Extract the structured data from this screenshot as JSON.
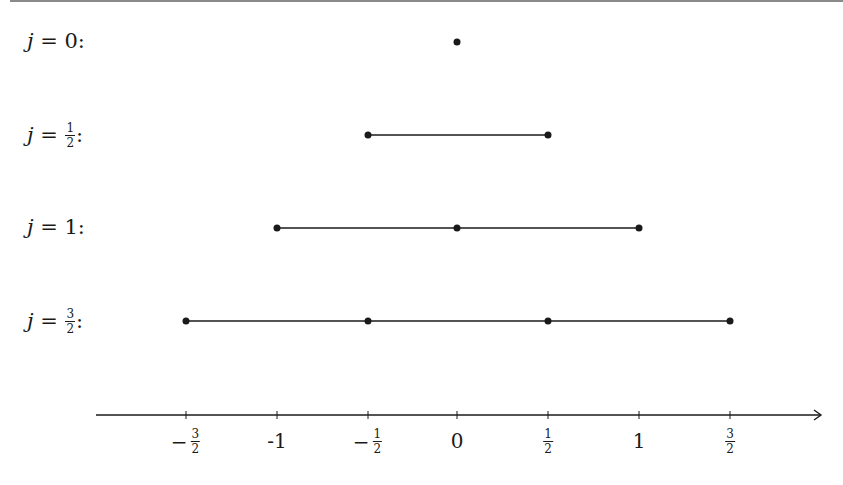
{
  "diagram": {
    "type": "angular-momentum-multiplets",
    "axis": {
      "label_ticks": [
        {
          "value": -1.5,
          "label_sign": "−",
          "label_num": "3",
          "label_den": "2",
          "is_fraction": true,
          "x": 186
        },
        {
          "value": -1,
          "label": "-1",
          "is_fraction": false,
          "x": 277
        },
        {
          "value": -0.5,
          "label_sign": "−",
          "label_num": "1",
          "label_den": "2",
          "is_fraction": true,
          "x": 368
        },
        {
          "value": 0,
          "label": "0",
          "is_fraction": false,
          "x": 457
        },
        {
          "value": 0.5,
          "label_sign": "",
          "label_num": "1",
          "label_den": "2",
          "is_fraction": true,
          "x": 548
        },
        {
          "value": 1,
          "label": "1",
          "is_fraction": false,
          "x": 639
        },
        {
          "value": 1.5,
          "label_sign": "",
          "label_num": "3",
          "label_den": "2",
          "is_fraction": true,
          "x": 730
        }
      ],
      "direction": "right-arrow"
    },
    "rows": [
      {
        "var": "j",
        "eq": " = ",
        "value": "0",
        "is_fraction": false,
        "suffix": ":",
        "points": [
          0
        ]
      },
      {
        "var": "j",
        "eq": " = ",
        "num": "1",
        "den": "2",
        "is_fraction": true,
        "suffix": ":",
        "points": [
          -0.5,
          0.5
        ]
      },
      {
        "var": "j",
        "eq": " = ",
        "value": "1",
        "is_fraction": false,
        "suffix": ":",
        "points": [
          -1,
          0,
          1
        ]
      },
      {
        "var": "j",
        "eq": " = ",
        "num": "3",
        "den": "2",
        "is_fraction": true,
        "suffix": ":",
        "points": [
          -1.5,
          -0.5,
          0.5,
          1.5
        ]
      }
    ],
    "colors": {
      "ink": "#1a1a1a",
      "background": "#ffffff"
    }
  }
}
